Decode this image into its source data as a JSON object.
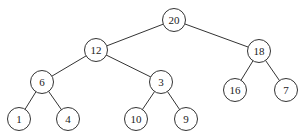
{
  "tree": {
    "nodes": [
      {
        "id": "n20",
        "label": "20",
        "x": 174,
        "y": 20
      },
      {
        "id": "n12",
        "label": "12",
        "x": 96,
        "y": 50
      },
      {
        "id": "n18",
        "label": "18",
        "x": 259,
        "y": 51
      },
      {
        "id": "n6",
        "label": "6",
        "x": 42,
        "y": 82
      },
      {
        "id": "n3",
        "label": "3",
        "x": 161,
        "y": 82
      },
      {
        "id": "n16",
        "label": "16",
        "x": 235,
        "y": 90
      },
      {
        "id": "n7",
        "label": "7",
        "x": 286,
        "y": 90
      },
      {
        "id": "n1",
        "label": "1",
        "x": 19,
        "y": 119
      },
      {
        "id": "n4",
        "label": "4",
        "x": 68,
        "y": 119
      },
      {
        "id": "n10",
        "label": "10",
        "x": 136,
        "y": 119
      },
      {
        "id": "n9",
        "label": "9",
        "x": 186,
        "y": 119
      }
    ],
    "edges": [
      [
        "n20",
        "n12"
      ],
      [
        "n20",
        "n18"
      ],
      [
        "n12",
        "n6"
      ],
      [
        "n12",
        "n3"
      ],
      [
        "n18",
        "n16"
      ],
      [
        "n18",
        "n7"
      ],
      [
        "n6",
        "n1"
      ],
      [
        "n6",
        "n4"
      ],
      [
        "n3",
        "n10"
      ],
      [
        "n3",
        "n9"
      ]
    ]
  }
}
